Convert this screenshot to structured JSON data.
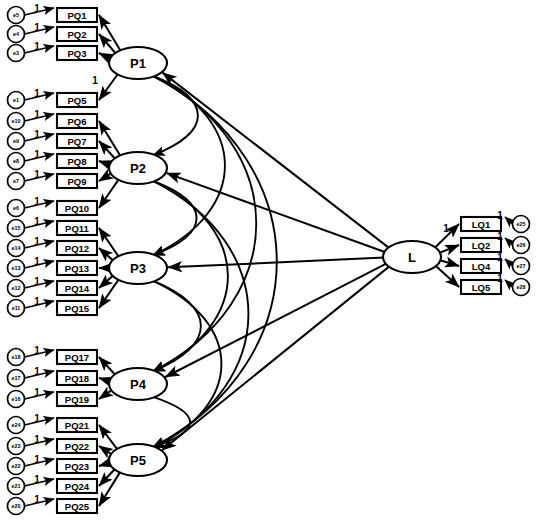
{
  "diagram": {
    "type": "sem-path-diagram",
    "caption": "",
    "colors": {
      "stroke": "#000000",
      "fill": "#ffffff",
      "background": "#ffffff"
    },
    "latent_factors": [
      {
        "id": "P1",
        "label": "P1",
        "cx": 138,
        "cy": 63,
        "rx": 29,
        "ry": 16
      },
      {
        "id": "P2",
        "label": "P2",
        "cx": 138,
        "cy": 168,
        "rx": 29,
        "ry": 16
      },
      {
        "id": "P3",
        "label": "P3",
        "cx": 138,
        "cy": 268,
        "rx": 29,
        "ry": 16
      },
      {
        "id": "P4",
        "label": "P4",
        "cx": 138,
        "cy": 384,
        "rx": 29,
        "ry": 16
      },
      {
        "id": "P5",
        "label": "P5",
        "cx": 138,
        "cy": 460,
        "rx": 29,
        "ry": 16
      },
      {
        "id": "L",
        "label": "L",
        "cx": 412,
        "cy": 257,
        "rx": 29,
        "ry": 16
      }
    ],
    "indicators_left": [
      {
        "id": "PQ1",
        "label": "PQ1",
        "x": 57,
        "y": 8,
        "factor": "P1"
      },
      {
        "id": "PQ2",
        "label": "PQ2",
        "x": 57,
        "y": 27,
        "factor": "P1"
      },
      {
        "id": "PQ3",
        "label": "PQ3",
        "x": 57,
        "y": 46,
        "factor": "P1"
      },
      {
        "id": "PQ5",
        "label": "PQ5",
        "x": 57,
        "y": 93,
        "factor": "P1"
      },
      {
        "id": "PQ6",
        "label": "PQ6",
        "x": 57,
        "y": 114,
        "factor": "P2"
      },
      {
        "id": "PQ7",
        "label": "PQ7",
        "x": 57,
        "y": 134,
        "factor": "P2"
      },
      {
        "id": "PQ8",
        "label": "PQ8",
        "x": 57,
        "y": 154,
        "factor": "P2"
      },
      {
        "id": "PQ9",
        "label": "PQ9",
        "x": 57,
        "y": 174,
        "factor": "P2"
      },
      {
        "id": "PQ10",
        "label": "PQ10",
        "x": 57,
        "y": 201,
        "factor": "P2"
      },
      {
        "id": "PQ11",
        "label": "PQ11",
        "x": 57,
        "y": 221,
        "factor": "P3"
      },
      {
        "id": "PQ12",
        "label": "PQ12",
        "x": 57,
        "y": 241,
        "factor": "P3"
      },
      {
        "id": "PQ13",
        "label": "PQ13",
        "x": 57,
        "y": 261,
        "factor": "P3"
      },
      {
        "id": "PQ14",
        "label": "PQ14",
        "x": 57,
        "y": 281,
        "factor": "P3"
      },
      {
        "id": "PQ15",
        "label": "PQ15",
        "x": 57,
        "y": 301,
        "factor": "P3"
      },
      {
        "id": "PQ17",
        "label": "PQ17",
        "x": 57,
        "y": 350,
        "factor": "P4"
      },
      {
        "id": "PQ18",
        "label": "PQ18",
        "x": 57,
        "y": 371,
        "factor": "P4"
      },
      {
        "id": "PQ19",
        "label": "PQ19",
        "x": 57,
        "y": 392,
        "factor": "P4"
      },
      {
        "id": "PQ21",
        "label": "PQ21",
        "x": 57,
        "y": 418,
        "factor": "P5"
      },
      {
        "id": "PQ22",
        "label": "PQ22",
        "x": 57,
        "y": 439,
        "factor": "P5"
      },
      {
        "id": "PQ23",
        "label": "PQ23",
        "x": 57,
        "y": 459,
        "factor": "P5"
      },
      {
        "id": "PQ24",
        "label": "PQ24",
        "x": 57,
        "y": 479,
        "factor": "P5"
      },
      {
        "id": "PQ25",
        "label": "PQ25",
        "x": 57,
        "y": 499,
        "factor": "P5"
      }
    ],
    "indicators_right": [
      {
        "id": "LQ1",
        "label": "LQ1",
        "x": 461,
        "y": 217,
        "factor": "L"
      },
      {
        "id": "LQ2",
        "label": "LQ2",
        "x": 461,
        "y": 238,
        "factor": "L"
      },
      {
        "id": "LQ4",
        "label": "LQ4",
        "x": 461,
        "y": 259,
        "factor": "L"
      },
      {
        "id": "LQ5",
        "label": "LQ5",
        "x": 461,
        "y": 280,
        "factor": "L"
      }
    ],
    "errors_left": [
      {
        "id": "e5",
        "label": "e5",
        "cx": 16,
        "cy": 15,
        "target": "PQ1"
      },
      {
        "id": "e4",
        "label": "e4",
        "cx": 16,
        "cy": 34,
        "target": "PQ2"
      },
      {
        "id": "e3",
        "label": "e3",
        "cx": 16,
        "cy": 53,
        "target": "PQ3"
      },
      {
        "id": "e1",
        "label": "e1",
        "cx": 16,
        "cy": 100,
        "target": "PQ5"
      },
      {
        "id": "e10",
        "label": "e10",
        "cx": 16,
        "cy": 121,
        "target": "PQ6"
      },
      {
        "id": "e9",
        "label": "e9",
        "cx": 16,
        "cy": 141,
        "target": "PQ7"
      },
      {
        "id": "e8",
        "label": "e8",
        "cx": 16,
        "cy": 161,
        "target": "PQ8"
      },
      {
        "id": "e7",
        "label": "e7",
        "cx": 16,
        "cy": 181,
        "target": "PQ9"
      },
      {
        "id": "e6",
        "label": "e6",
        "cx": 16,
        "cy": 208,
        "target": "PQ10"
      },
      {
        "id": "e15",
        "label": "e15",
        "cx": 16,
        "cy": 228,
        "target": "PQ11"
      },
      {
        "id": "e14",
        "label": "e14",
        "cx": 16,
        "cy": 248,
        "target": "PQ12"
      },
      {
        "id": "e13",
        "label": "e13",
        "cx": 16,
        "cy": 268,
        "target": "PQ13"
      },
      {
        "id": "e12",
        "label": "e12",
        "cx": 16,
        "cy": 288,
        "target": "PQ14"
      },
      {
        "id": "e11",
        "label": "e11",
        "cx": 16,
        "cy": 308,
        "target": "PQ15"
      },
      {
        "id": "e18",
        "label": "e18",
        "cx": 16,
        "cy": 357,
        "target": "PQ17"
      },
      {
        "id": "e17",
        "label": "e17",
        "cx": 16,
        "cy": 378,
        "target": "PQ18"
      },
      {
        "id": "e16",
        "label": "e16",
        "cx": 16,
        "cy": 399,
        "target": "PQ19"
      },
      {
        "id": "e24",
        "label": "e24",
        "cx": 16,
        "cy": 425,
        "target": "PQ21"
      },
      {
        "id": "e23",
        "label": "e23",
        "cx": 16,
        "cy": 446,
        "target": "PQ22"
      },
      {
        "id": "e22",
        "label": "e22",
        "cx": 16,
        "cy": 466,
        "target": "PQ23"
      },
      {
        "id": "e21",
        "label": "e21",
        "cx": 16,
        "cy": 486,
        "target": "PQ24"
      },
      {
        "id": "e20",
        "label": "e20",
        "cx": 16,
        "cy": 506,
        "target": "PQ25"
      }
    ],
    "errors_right": [
      {
        "id": "e25",
        "label": "e25",
        "cx": 521,
        "cy": 224,
        "target": "LQ1"
      },
      {
        "id": "e26",
        "label": "e26",
        "cx": 521,
        "cy": 245,
        "target": "LQ2"
      },
      {
        "id": "e27",
        "label": "e27",
        "cx": 521,
        "cy": 266,
        "target": "LQ4"
      },
      {
        "id": "e28",
        "label": "e28",
        "cx": 521,
        "cy": 287,
        "target": "LQ5"
      }
    ],
    "error_coefficient_labels": [
      {
        "value": "1",
        "x": 37,
        "y": 8
      },
      {
        "value": "1",
        "x": 37,
        "y": 27
      },
      {
        "value": "1",
        "x": 37,
        "y": 46
      },
      {
        "value": "1",
        "x": 37,
        "y": 93
      },
      {
        "value": "1",
        "x": 37,
        "y": 114
      },
      {
        "value": "1",
        "x": 37,
        "y": 134
      },
      {
        "value": "1",
        "x": 37,
        "y": 154
      },
      {
        "value": "1",
        "x": 37,
        "y": 174
      },
      {
        "value": "1",
        "x": 37,
        "y": 201
      },
      {
        "value": "1",
        "x": 37,
        "y": 221
      },
      {
        "value": "1",
        "x": 37,
        "y": 241
      },
      {
        "value": "1",
        "x": 37,
        "y": 261
      },
      {
        "value": "1",
        "x": 37,
        "y": 281
      },
      {
        "value": "1",
        "x": 37,
        "y": 301
      },
      {
        "value": "1",
        "x": 37,
        "y": 350
      },
      {
        "value": "1",
        "x": 37,
        "y": 371
      },
      {
        "value": "1",
        "x": 37,
        "y": 392
      },
      {
        "value": "1",
        "x": 37,
        "y": 418
      },
      {
        "value": "1",
        "x": 37,
        "y": 439
      },
      {
        "value": "1",
        "x": 37,
        "y": 459
      },
      {
        "value": "1",
        "x": 37,
        "y": 479
      },
      {
        "value": "1",
        "x": 37,
        "y": 499
      },
      {
        "value": "1",
        "x": 500,
        "y": 215
      },
      {
        "value": "1",
        "x": 500,
        "y": 236
      },
      {
        "value": "1",
        "x": 500,
        "y": 257
      },
      {
        "value": "1",
        "x": 500,
        "y": 278
      }
    ],
    "loading_coefficient_labels": [
      {
        "value": "1",
        "x": 95,
        "y": 80
      },
      {
        "value": "1",
        "x": 446,
        "y": 228
      }
    ],
    "correlation_arcs": [
      {
        "from": "P1",
        "to": "P2"
      },
      {
        "from": "P2",
        "to": "P3"
      },
      {
        "from": "P3",
        "to": "P4"
      },
      {
        "from": "P4",
        "to": "P5"
      },
      {
        "from": "P1",
        "to": "P3"
      },
      {
        "from": "P2",
        "to": "P4"
      },
      {
        "from": "P3",
        "to": "P5"
      },
      {
        "from": "P1",
        "to": "P4"
      },
      {
        "from": "P2",
        "to": "P5"
      },
      {
        "from": "P1",
        "to": "P5"
      }
    ],
    "structural_paths": [
      {
        "from": "L",
        "to": "P1"
      },
      {
        "from": "L",
        "to": "P2"
      },
      {
        "from": "L",
        "to": "P3"
      },
      {
        "from": "L",
        "to": "P4"
      },
      {
        "from": "L",
        "to": "P5"
      }
    ]
  }
}
